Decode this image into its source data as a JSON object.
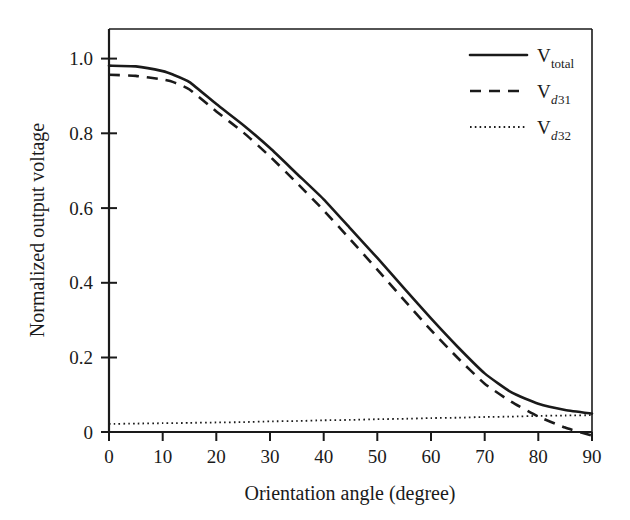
{
  "figure": {
    "background": "#ffffff",
    "ink_color": "#1a1a1a"
  },
  "chart_data": {
    "type": "line",
    "title": "",
    "xlabel": "Orientation angle (degree)",
    "ylabel": "Normalized output voltage",
    "xlim": [
      0,
      90
    ],
    "ylim": [
      0,
      1.1
    ],
    "grid": false,
    "legend_position": "top-right",
    "xticks": [
      0,
      10,
      20,
      30,
      40,
      50,
      60,
      70,
      80,
      90
    ],
    "xtick_labels": [
      "0",
      "10",
      "20",
      "30",
      "40",
      "50",
      "60",
      "70",
      "80",
      "90"
    ],
    "yticks": [
      0,
      0.2,
      0.4,
      0.6,
      0.8,
      1.0
    ],
    "ytick_labels": [
      "0",
      "0.2",
      "0.4",
      "0.6",
      "0.8",
      "1.0"
    ],
    "x": [
      0,
      5,
      10,
      12,
      15,
      20,
      25,
      30,
      35,
      40,
      45,
      50,
      55,
      60,
      65,
      70,
      75,
      80,
      85,
      90
    ],
    "series": [
      {
        "name": "V_total",
        "legend_main": "V",
        "legend_sub_italic": "",
        "legend_sub": "total",
        "style": "solid",
        "values": [
          1.0,
          0.998,
          0.985,
          0.975,
          0.955,
          0.895,
          0.838,
          0.775,
          0.705,
          0.635,
          0.555,
          0.475,
          0.392,
          0.31,
          0.232,
          0.16,
          0.108,
          0.077,
          0.06,
          0.05
        ]
      },
      {
        "name": "V_d31",
        "legend_main": "V",
        "legend_sub_italic": "d",
        "legend_sub": "31",
        "style": "dashed",
        "values": [
          0.975,
          0.972,
          0.962,
          0.955,
          0.935,
          0.875,
          0.818,
          0.752,
          0.68,
          0.605,
          0.525,
          0.443,
          0.36,
          0.278,
          0.202,
          0.132,
          0.082,
          0.042,
          0.012,
          -0.01
        ]
      },
      {
        "name": "V_d32",
        "legend_main": "V",
        "legend_sub_italic": "d",
        "legend_sub": "32",
        "style": "dotted",
        "values": [
          0.022,
          0.023,
          0.024,
          0.024,
          0.025,
          0.026,
          0.027,
          0.029,
          0.03,
          0.032,
          0.033,
          0.035,
          0.036,
          0.038,
          0.039,
          0.041,
          0.042,
          0.044,
          0.045,
          0.046
        ]
      }
    ]
  }
}
